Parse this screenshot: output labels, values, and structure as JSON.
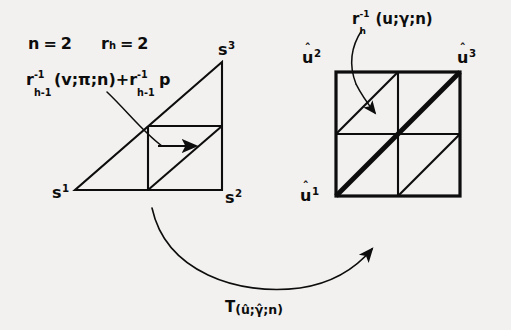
{
  "figure": {
    "name": "subdivision-transformation-diagram",
    "background_color": "#f2f1ef",
    "ink_color": "#0d0d0d",
    "parameters": {
      "n_label": "n = 2",
      "n_symbol": "n",
      "n_value": "2",
      "rh_symbol": "r",
      "rh_subscript": "h",
      "rh_value": "2",
      "rh_label": "r_h = 2"
    },
    "left_formula": {
      "full_text": "r_{h-1}^{-1}(v;π;n)+r_{h-1}^{-1} p",
      "base_symbol": "r",
      "superscript": "-1",
      "subscript": "h-1",
      "args": "(v;π;n)",
      "plus": "+",
      "base_symbol_2": "r",
      "superscript_2": "-1",
      "subscript_2": "h-1",
      "trailing": "p"
    },
    "right_formula": {
      "full_text": "r_h^{-1}(u;γ;n)",
      "base_symbol": "r",
      "superscript": "-1",
      "subscript": "h",
      "args": "(u;γ;n)"
    },
    "caption": {
      "operator": "T",
      "args": "(û;γ̂;n)",
      "full_text": "T_(û;γ̂;n)"
    },
    "left_shape": {
      "type": "right-triangle-subdivided",
      "vertices": [
        {
          "name": "s1",
          "base": "s",
          "index": "1",
          "position": "bottom-left"
        },
        {
          "name": "s2",
          "base": "s",
          "index": "2",
          "position": "bottom-right"
        },
        {
          "name": "s3",
          "base": "s",
          "index": "3",
          "position": "top-right"
        }
      ]
    },
    "right_shape": {
      "type": "square-2x2-subdivided",
      "vertices": [
        {
          "name": "u1",
          "base": "u",
          "index": "1",
          "hat": "ˆ",
          "position": "bottom-left"
        },
        {
          "name": "u2",
          "base": "u",
          "index": "2",
          "hat": "ˆ",
          "position": "top-left"
        },
        {
          "name": "u3",
          "base": "u",
          "index": "3",
          "hat": "ˆ",
          "position": "top-right"
        }
      ],
      "bold_diagonal": "bottom-left to top-right"
    }
  }
}
